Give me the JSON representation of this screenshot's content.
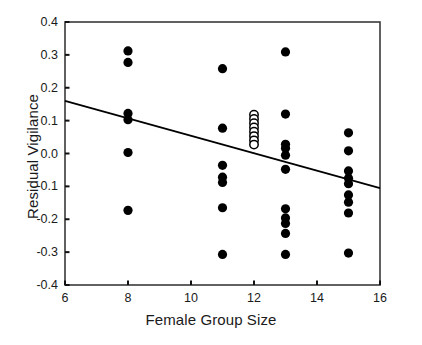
{
  "chart_data": {
    "type": "scatter",
    "title": "",
    "xlabel": "Female Group Size",
    "ylabel": "Residual Vigilance",
    "xlim": [
      6,
      16
    ],
    "ylim": [
      -0.4,
      0.4
    ],
    "xticks": [
      6,
      8,
      10,
      12,
      14,
      16
    ],
    "xticklabels": [
      "6",
      "8",
      "10",
      "12",
      "14",
      "16"
    ],
    "yticks": [
      -0.4,
      -0.3,
      -0.2,
      -0.1,
      0.0,
      0.1,
      0.2,
      0.3,
      0.4
    ],
    "yticklabels": [
      "-0.4",
      "-0.3",
      "-0.2",
      "-0.1",
      "0.0",
      "0.1",
      "0.2",
      "0.3",
      "0.4"
    ],
    "grid": false,
    "legend": false,
    "marker_colors": {
      "filled": "#000000",
      "open_fill": "#ffffff",
      "open_edge": "#000000"
    },
    "series": [
      {
        "name": "filled-points",
        "marker": "filled-circle",
        "points": [
          {
            "x": 8,
            "y": 0.312
          },
          {
            "x": 8,
            "y": 0.277
          },
          {
            "x": 8,
            "y": 0.122
          },
          {
            "x": 8,
            "y": 0.103
          },
          {
            "x": 8,
            "y": 0.003
          },
          {
            "x": 8,
            "y": -0.173
          },
          {
            "x": 11,
            "y": 0.258
          },
          {
            "x": 11,
            "y": 0.077
          },
          {
            "x": 11,
            "y": -0.036
          },
          {
            "x": 11,
            "y": -0.072
          },
          {
            "x": 11,
            "y": -0.088
          },
          {
            "x": 11,
            "y": -0.165
          },
          {
            "x": 11,
            "y": -0.307
          },
          {
            "x": 13,
            "y": 0.309
          },
          {
            "x": 13,
            "y": 0.12
          },
          {
            "x": 13,
            "y": 0.028
          },
          {
            "x": 13,
            "y": 0.016
          },
          {
            "x": 13,
            "y": -0.005
          },
          {
            "x": 13,
            "y": -0.048
          },
          {
            "x": 13,
            "y": -0.168
          },
          {
            "x": 13,
            "y": -0.196
          },
          {
            "x": 13,
            "y": -0.213
          },
          {
            "x": 13,
            "y": -0.243
          },
          {
            "x": 13,
            "y": -0.307
          },
          {
            "x": 15,
            "y": 0.063
          },
          {
            "x": 15,
            "y": 0.008
          },
          {
            "x": 15,
            "y": -0.053
          },
          {
            "x": 15,
            "y": -0.075
          },
          {
            "x": 15,
            "y": -0.092
          },
          {
            "x": 15,
            "y": -0.126
          },
          {
            "x": 15,
            "y": -0.148
          },
          {
            "x": 15,
            "y": -0.181
          },
          {
            "x": 15,
            "y": -0.303
          }
        ]
      },
      {
        "name": "open-points",
        "marker": "open-circle",
        "points": [
          {
            "x": 12,
            "y": 0.118
          },
          {
            "x": 12,
            "y": 0.105
          },
          {
            "x": 12,
            "y": 0.092
          },
          {
            "x": 12,
            "y": 0.079
          },
          {
            "x": 12,
            "y": 0.066
          },
          {
            "x": 12,
            "y": 0.053
          },
          {
            "x": 12,
            "y": 0.04
          },
          {
            "x": 12,
            "y": 0.027
          }
        ]
      }
    ],
    "trendline": {
      "name": "regression-line",
      "x_start": 6,
      "y_start": 0.16,
      "x_end": 16,
      "y_end": -0.105,
      "color": "#000000"
    }
  },
  "axes": {
    "frame_color": "#3a3a3a"
  }
}
